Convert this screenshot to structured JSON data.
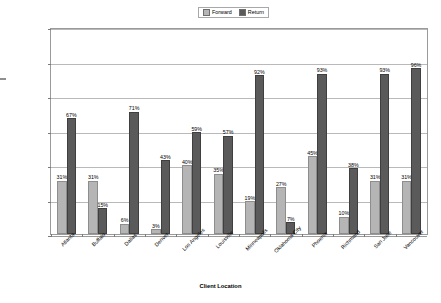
{
  "chart_data": {
    "type": "bar",
    "title": "",
    "xlabel": "Client Location",
    "ylabel": "Percent Utilization",
    "ylim": [
      0,
      120
    ],
    "ytick_labels": [
      "0%",
      "20%",
      "40%",
      "60%",
      "80%",
      "100%",
      "120%"
    ],
    "ytick_values": [
      0,
      20,
      40,
      60,
      80,
      100,
      120
    ],
    "grid": true,
    "legend_position": "top-center",
    "value_label_suffix": "%",
    "categories": [
      "Atlanta",
      "Buffalo",
      "Dallas",
      "Denver",
      "Los Angeles",
      "Louisville",
      "Minneapolis",
      "Oklahoma City",
      "Phoenix",
      "Richmond",
      "San Jose",
      "Vancouver"
    ],
    "series": [
      {
        "name": "Forward",
        "color": "#b5b5b5",
        "values": [
          31,
          31,
          6,
          3,
          40,
          35,
          19,
          27,
          45,
          10,
          31,
          31
        ],
        "labels": [
          "31%",
          "31%",
          "6%",
          "3%",
          "40%",
          "35%",
          "19%",
          "27%",
          "45%",
          "10%",
          "31%",
          "31%"
        ]
      },
      {
        "name": "Return",
        "color": "#5a5a5a",
        "values": [
          67,
          15,
          71,
          43,
          59,
          57,
          92,
          7,
          93,
          38,
          93,
          96
        ],
        "labels": [
          "67%",
          "15%",
          "71%",
          "43%",
          "59%",
          "57%",
          "92%",
          "7%",
          "93%",
          "38%",
          "93%",
          "96%"
        ]
      }
    ]
  },
  "legend": {
    "items": [
      {
        "label": "Forward"
      },
      {
        "label": "Return"
      }
    ]
  },
  "colors": {
    "forward": "#b5b5b5",
    "return": "#5a5a5a",
    "grid": "#b9b9b9",
    "frame": "#9a9a9a"
  }
}
